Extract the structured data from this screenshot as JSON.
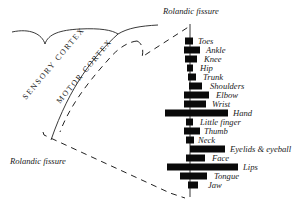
{
  "figure": {
    "labels": {
      "rolandic_top": "Rolandic fissure",
      "rolandic_bottom": "Rolandic fissure",
      "sensory_cortex": "SENSORY CORTEX",
      "motor_cortex": "MOTOR CORTEX"
    },
    "axis": {
      "x": 190,
      "y_top": 24,
      "y_bottom": 197
    },
    "body_parts": [
      {
        "label": "Toes",
        "y": 41,
        "left": 185,
        "right": 193
      },
      {
        "label": "Ankle",
        "y": 50,
        "left": 184,
        "right": 200
      },
      {
        "label": "Knee",
        "y": 59,
        "left": 185,
        "right": 197
      },
      {
        "label": "Hip",
        "y": 68,
        "left": 187,
        "right": 193
      },
      {
        "label": "Trunk",
        "y": 77,
        "left": 188,
        "right": 196
      },
      {
        "label": "Shoulders",
        "y": 86,
        "left": 189,
        "right": 202
      },
      {
        "label": "Elbow",
        "y": 95,
        "left": 184,
        "right": 209
      },
      {
        "label": "Wrist",
        "y": 104,
        "left": 184,
        "right": 206
      },
      {
        "label": "Hand",
        "y": 113,
        "left": 165,
        "right": 228
      },
      {
        "label": "Little finger",
        "y": 122,
        "left": 186,
        "right": 193
      },
      {
        "label": "Thumb",
        "y": 131,
        "left": 184,
        "right": 200
      },
      {
        "label": "Neck",
        "y": 140,
        "left": 186,
        "right": 194
      },
      {
        "label": "Eyelids & eyeball",
        "y": 149,
        "left": 190,
        "right": 225
      },
      {
        "label": "Face",
        "y": 158,
        "left": 186,
        "right": 205
      },
      {
        "label": "Lips",
        "y": 167,
        "left": 167,
        "right": 238
      },
      {
        "label": "Tongue",
        "y": 176,
        "left": 180,
        "right": 207
      },
      {
        "label": "Jaw",
        "y": 185,
        "left": 188,
        "right": 198
      }
    ],
    "label_x": [
      198,
      206,
      204,
      200,
      203,
      210,
      216,
      212,
      233,
      200,
      204,
      198,
      230,
      212,
      243,
      214,
      208
    ]
  }
}
